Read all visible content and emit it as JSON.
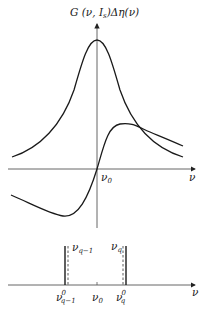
{
  "figure": {
    "top_panel": {
      "y_axis_label": "G (ν, I",
      "y_axis_label_sub": "s",
      "y_axis_label_tail": ")Δη(ν)",
      "x_axis_label": "ν",
      "origin_label": "ν",
      "origin_label_sub": "0",
      "curves": [
        {
          "name": "gain-lorentzian",
          "shape": "symmetric peak centered at ν0"
        },
        {
          "name": "dispersion",
          "shape": "antisymmetric, zero at ν0"
        }
      ]
    },
    "bottom_panel": {
      "x_axis_label": "ν",
      "center_label": "ν",
      "center_label_sub": "0",
      "modes": [
        {
          "cavity_label": "ν",
          "cavity_label_sub": "q−1",
          "pulled_label": "ν",
          "pulled_label_sup": "0",
          "pulled_label_sub": "q−1"
        },
        {
          "cavity_label": "ν",
          "cavity_label_sub": "q",
          "pulled_label": "ν",
          "pulled_label_sup": "0",
          "pulled_label_sub": "q"
        }
      ]
    }
  },
  "colors": {
    "curve": "#1a1a1a",
    "axis": "#444444",
    "text": "#222222"
  }
}
